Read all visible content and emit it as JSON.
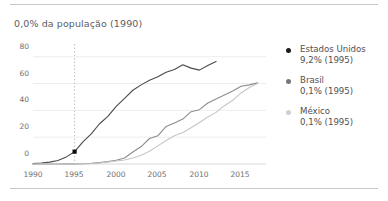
{
  "chart_data": {
    "type": "line",
    "title": "0,0% da população (1990)",
    "xlabel": "",
    "ylabel": "",
    "xlim": [
      1990,
      2018
    ],
    "ylim": [
      0,
      88
    ],
    "grid": true,
    "legend_position": "right",
    "y_ticks": [
      "0",
      "20",
      "40",
      "60",
      "80"
    ],
    "y_tick_values": [
      0,
      20,
      40,
      60,
      80
    ],
    "x_ticks": [
      "1990",
      "1995",
      "2000",
      "2005",
      "2010",
      "2015"
    ],
    "x_tick_values": [
      1990,
      1995,
      2000,
      2005,
      2010,
      2015
    ],
    "highlight_year": 1995,
    "annotations": [
      {
        "label": "marcador 1995",
        "x": 1995,
        "y": 9.2,
        "series": "Estados Unidos"
      }
    ],
    "series": [
      {
        "name": "Estados Unidos",
        "color": "#4a4a4c",
        "legend_value": "9,2% (1995)",
        "x": [
          1990,
          1991,
          1992,
          1993,
          1994,
          1995,
          1996,
          1997,
          1998,
          1999,
          2000,
          2001,
          2002,
          2003,
          2004,
          2005,
          2006,
          2007,
          2008,
          2009,
          2010,
          2011,
          2012
        ],
        "values": [
          0.3,
          0.7,
          1.4,
          2.6,
          5.3,
          9.2,
          16.5,
          22.5,
          30.0,
          35.5,
          43.0,
          49.0,
          55.0,
          59.0,
          62.5,
          65.0,
          68.5,
          70.5,
          74.0,
          71.5,
          70.0,
          73.5,
          76.5
        ]
      },
      {
        "name": "Brasil",
        "color": "#8d8d90",
        "legend_value": "0,1% (1995)",
        "x": [
          1990,
          1991,
          1992,
          1993,
          1994,
          1995,
          1996,
          1997,
          1998,
          1999,
          2000,
          2001,
          2002,
          2003,
          2004,
          2005,
          2006,
          2007,
          2008,
          2009,
          2010,
          2011,
          2012,
          2013,
          2014,
          2015,
          2016,
          2017
        ],
        "values": [
          0.0,
          0.0,
          0.0,
          0.0,
          0.1,
          0.1,
          0.2,
          0.5,
          1.0,
          1.8,
          2.8,
          4.5,
          9.0,
          13.0,
          19.0,
          21.0,
          28.0,
          30.5,
          33.5,
          39.0,
          40.5,
          45.5,
          48.5,
          51.5,
          54.5,
          58.0,
          59.0,
          60.5
        ]
      },
      {
        "name": "México",
        "color": "#c6c6c8",
        "legend_value": "0,1% (1995)",
        "x": [
          1990,
          1991,
          1992,
          1993,
          1994,
          1995,
          1996,
          1997,
          1998,
          1999,
          2000,
          2001,
          2002,
          2003,
          2004,
          2005,
          2006,
          2007,
          2008,
          2009,
          2010,
          2011,
          2012,
          2013,
          2014,
          2015,
          2016,
          2017
        ],
        "values": [
          0.0,
          0.0,
          0.0,
          0.0,
          0.0,
          0.1,
          0.2,
          0.4,
          0.8,
          1.5,
          2.2,
          3.0,
          4.5,
          6.5,
          9.5,
          13.5,
          17.5,
          21.0,
          23.5,
          27.0,
          31.0,
          35.0,
          38.5,
          43.5,
          47.5,
          53.0,
          57.0,
          60.0
        ]
      }
    ]
  },
  "legend": [
    {
      "name": "Estados Unidos",
      "value": "9,2% (1995)",
      "color": "#1c1c1c"
    },
    {
      "name": "Brasil",
      "value": "0,1% (1995)",
      "color": "#77777a"
    },
    {
      "name": "México",
      "value": "0,1% (1995)",
      "color": "#cfcfd1"
    }
  ]
}
